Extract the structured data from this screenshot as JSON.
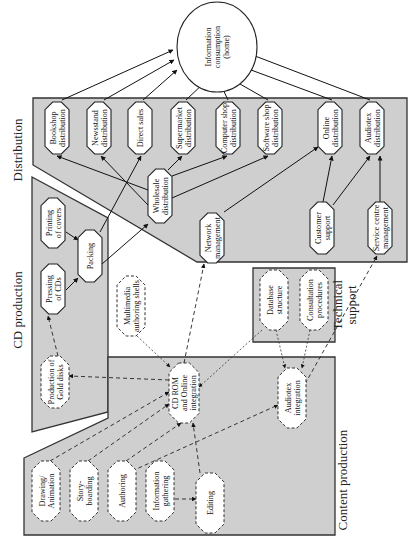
{
  "orientation": "rotated-90-ccw",
  "colors": {
    "panel_fill": "#cfcfcf",
    "panel_stroke": "#333333",
    "node_fill": "#ffffff",
    "edge": "#111111"
  },
  "panels": [
    {
      "id": "distribution",
      "label": "Distribution",
      "points": "33,98 407,98 407,262 197,262 33,165",
      "label_x": 22,
      "label_y": 150
    },
    {
      "id": "cd_production",
      "label": "CD production",
      "points": "32,177 108,218 108,412 32,432",
      "label_x": 22,
      "label_y": 310
    },
    {
      "id": "technical_support",
      "label": "Technical support",
      "points": "253,268 335,268 335,342 253,342",
      "label_x": 342,
      "label_y": 305
    },
    {
      "id": "content_production",
      "label": "Content production",
      "points": "24,458 108,418 108,357 335,357 335,535 24,535",
      "label_x": 347,
      "label_y": 480
    }
  ],
  "nodes": [
    {
      "id": "home",
      "label": [
        "Information",
        "consumption",
        "(home)"
      ],
      "shape": "ellipse",
      "style": "solid",
      "cx": 217,
      "cy": 47,
      "w": 80,
      "h": 90
    },
    {
      "id": "bookshop",
      "label": [
        "Bookshop",
        "distribution"
      ],
      "shape": "octagon",
      "style": "solid",
      "cx": 57,
      "cy": 128,
      "w": 24,
      "h": 52
    },
    {
      "id": "newsstand",
      "label": [
        "Newsstand",
        "distribution"
      ],
      "shape": "octagon",
      "style": "solid",
      "cx": 99,
      "cy": 128,
      "w": 24,
      "h": 52
    },
    {
      "id": "direct_sales",
      "label": [
        "Direct sales"
      ],
      "shape": "octagon",
      "style": "solid",
      "cx": 140,
      "cy": 128,
      "w": 24,
      "h": 52
    },
    {
      "id": "supermarket",
      "label": [
        "Supermarket",
        "distribution"
      ],
      "shape": "octagon",
      "style": "solid",
      "cx": 183,
      "cy": 128,
      "w": 24,
      "h": 52
    },
    {
      "id": "computer_shop",
      "label": [
        "Computer shop",
        "distribution"
      ],
      "shape": "octagon",
      "style": "solid",
      "cx": 228,
      "cy": 128,
      "w": 24,
      "h": 52
    },
    {
      "id": "software_shop",
      "label": [
        "Software shop",
        "distribution"
      ],
      "shape": "octagon",
      "style": "solid",
      "cx": 270,
      "cy": 128,
      "w": 24,
      "h": 52
    },
    {
      "id": "online_dist",
      "label": [
        "Online",
        "distribution"
      ],
      "shape": "octagon",
      "style": "solid",
      "cx": 330,
      "cy": 128,
      "w": 24,
      "h": 52
    },
    {
      "id": "audiotex_dist",
      "label": [
        "Audiotex",
        "distribution"
      ],
      "shape": "octagon",
      "style": "solid",
      "cx": 372,
      "cy": 128,
      "w": 24,
      "h": 52
    },
    {
      "id": "wholesale",
      "label": [
        "Wholesale",
        "distribution"
      ],
      "shape": "octagon",
      "style": "solid",
      "cx": 160,
      "cy": 196,
      "w": 24,
      "h": 54
    },
    {
      "id": "network_mgmt",
      "label": [
        "Network",
        "management"
      ],
      "shape": "octagon",
      "style": "solid",
      "cx": 212,
      "cy": 238,
      "w": 24,
      "h": 50
    },
    {
      "id": "customer_support",
      "label": [
        "Customer",
        "support"
      ],
      "shape": "octagon",
      "style": "solid",
      "cx": 322,
      "cy": 228,
      "w": 24,
      "h": 52
    },
    {
      "id": "service_centre",
      "label": [
        "Service centre",
        "management"
      ],
      "shape": "octagon",
      "style": "solid",
      "cx": 380,
      "cy": 228,
      "w": 24,
      "h": 52
    },
    {
      "id": "printing_covers",
      "label": [
        "Printing",
        "of covers"
      ],
      "shape": "octagon",
      "style": "solid",
      "cx": 53,
      "cy": 223,
      "w": 24,
      "h": 50
    },
    {
      "id": "pressing_cds",
      "label": [
        "Pressing",
        "of CDs"
      ],
      "shape": "octagon",
      "style": "solid",
      "cx": 53,
      "cy": 289,
      "w": 24,
      "h": 50
    },
    {
      "id": "packing",
      "label": [
        "Packing"
      ],
      "shape": "octagon",
      "style": "solid",
      "cx": 90,
      "cy": 256,
      "w": 24,
      "h": 52
    },
    {
      "id": "gold_disks",
      "label": [
        "Production of",
        "Gold disks"
      ],
      "shape": "octagon",
      "style": "dashed",
      "cx": 55,
      "cy": 382,
      "w": 28,
      "h": 52
    },
    {
      "id": "multimedia_shells",
      "label": [
        "Multimedia",
        "authoring shells"
      ],
      "shape": "octagon",
      "style": "dashed",
      "cx": 131,
      "cy": 306,
      "w": 28,
      "h": 60
    },
    {
      "id": "database_structure",
      "label": [
        "Database",
        "structure"
      ],
      "shape": "octagon",
      "style": "dashed",
      "cx": 274,
      "cy": 300,
      "w": 28,
      "h": 60
    },
    {
      "id": "consultation",
      "label": [
        "Consultation",
        "procedures"
      ],
      "shape": "octagon",
      "style": "dashed",
      "cx": 314,
      "cy": 300,
      "w": 28,
      "h": 60
    },
    {
      "id": "cdrom_online",
      "label": [
        "CD ROM",
        "and Online",
        "integration"
      ],
      "shape": "octagon",
      "style": "dashed",
      "cx": 184,
      "cy": 393,
      "w": 30,
      "h": 60
    },
    {
      "id": "audiotex_integration",
      "label": [
        "Audiotex",
        "integration"
      ],
      "shape": "octagon",
      "style": "dashed",
      "cx": 292,
      "cy": 398,
      "w": 28,
      "h": 60
    },
    {
      "id": "drawing",
      "label": [
        "Drawing/",
        "Animation"
      ],
      "shape": "octagon",
      "style": "dashed",
      "cx": 46,
      "cy": 491,
      "w": 28,
      "h": 60
    },
    {
      "id": "storyboarding",
      "label": [
        "Story-",
        "boarding"
      ],
      "shape": "octagon",
      "style": "dashed",
      "cx": 84,
      "cy": 491,
      "w": 28,
      "h": 60
    },
    {
      "id": "authoring",
      "label": [
        "Authoring"
      ],
      "shape": "octagon",
      "style": "dashed",
      "cx": 122,
      "cy": 491,
      "w": 28,
      "h": 60
    },
    {
      "id": "info_gathering",
      "label": [
        "Information",
        "gathering"
      ],
      "shape": "octagon",
      "style": "dashed",
      "cx": 160,
      "cy": 491,
      "w": 28,
      "h": 60
    },
    {
      "id": "editing",
      "label": [
        "Editing"
      ],
      "shape": "octagon",
      "style": "dashed",
      "cx": 210,
      "cy": 503,
      "w": 28,
      "h": 60
    }
  ],
  "edges": [
    {
      "from": "bookshop",
      "to": "home",
      "style": "solid",
      "d": "M62,100 L173,50"
    },
    {
      "from": "newsstand",
      "to": "home",
      "style": "solid",
      "d": "M104,100 L174,60"
    },
    {
      "from": "direct_sales",
      "to": "home",
      "style": "solid",
      "d": "M143,100 L177,70"
    },
    {
      "from": "supermarket",
      "to": "home",
      "style": "solid",
      "d": "M186,100 L205,82"
    },
    {
      "from": "computer_shop",
      "to": "home",
      "style": "solid",
      "d": "M228,100 L221,85"
    },
    {
      "from": "software_shop",
      "to": "home",
      "style": "solid",
      "d": "M268,100 L233,80"
    },
    {
      "from": "online_dist",
      "to": "home",
      "style": "solid",
      "d": "M332,100 L243,67"
    },
    {
      "from": "audiotex_dist",
      "to": "home",
      "style": "solid",
      "d": "M370,100 L242,51"
    },
    {
      "from": "wholesale",
      "to": "bookshop",
      "style": "solid",
      "d": "M148,190 L57,156"
    },
    {
      "from": "wholesale",
      "to": "newsstand",
      "style": "solid",
      "d": "M148,205 L101,156"
    },
    {
      "from": "wholesale",
      "to": "supermarket",
      "style": "solid",
      "d": "M168,170 L182,156"
    },
    {
      "from": "wholesale",
      "to": "computer_shop",
      "style": "solid",
      "d": "M172,176 L227,156"
    },
    {
      "from": "wholesale",
      "to": "software_shop",
      "style": "solid",
      "d": "M172,198 L268,156"
    },
    {
      "from": "network_mgmt",
      "to": "online_dist",
      "style": "solid",
      "d": "M224,212 L318,147"
    },
    {
      "from": "customer_support",
      "to": "online_dist",
      "style": "solid",
      "d": "M323,202 L332,156"
    },
    {
      "from": "customer_support",
      "to": "audiotex_dist",
      "style": "solid",
      "d": "M333,205 L370,156"
    },
    {
      "from": "service_centre",
      "to": "audiotex_dist",
      "style": "solid",
      "d": "M380,202 L380,156"
    },
    {
      "from": "printing_covers",
      "to": "packing",
      "style": "solid",
      "d": "M66,232 L78,240"
    },
    {
      "from": "pressing_cds",
      "to": "packing",
      "style": "solid",
      "d": "M66,290 L78,278"
    },
    {
      "from": "packing",
      "to": "direct_sales",
      "style": "solid",
      "d": "M100,232 L141,156"
    },
    {
      "from": "packing",
      "to": "wholesale",
      "style": "solid",
      "d": "M102,264 L148,224"
    },
    {
      "from": "gold_disks",
      "to": "pressing_cds",
      "style": "dashed",
      "d": "M58,356 L48,316"
    },
    {
      "from": "cdrom_online",
      "to": "gold_disks",
      "style": "dashed",
      "d": "M169,380 L69,376"
    },
    {
      "from": "cdrom_online",
      "to": "network_mgmt",
      "style": "dashed",
      "d": "M184,363 L204,264"
    },
    {
      "from": "multimedia_shells",
      "to": "cdrom_online",
      "style": "dotted",
      "d": "M137,336 L170,367"
    },
    {
      "from": "database_structure",
      "to": "cdrom_online",
      "style": "dotted",
      "d": "M262,330 L199,387"
    },
    {
      "from": "database_structure",
      "to": "audiotex_integration",
      "style": "dotted",
      "d": "M276,330 L285,368"
    },
    {
      "from": "consultation",
      "to": "audiotex_integration",
      "style": "dotted",
      "d": "M310,330 L302,368"
    },
    {
      "from": "audiotex_integration",
      "to": "service_centre",
      "style": "dashed",
      "d": "M305,384 L377,256"
    },
    {
      "from": "drawing",
      "to": "cdrom_online",
      "style": "dashed",
      "d": "M50,461 L169,392"
    },
    {
      "from": "storyboarding",
      "to": "cdrom_online",
      "style": "dashed",
      "d": "M88,461 L169,404"
    },
    {
      "from": "authoring",
      "to": "cdrom_online",
      "style": "dashed",
      "d": "M126,461 L181,423"
    },
    {
      "from": "authoring",
      "to": "audiotex_integration",
      "style": "dashed",
      "d": "M132,471 L278,405"
    },
    {
      "from": "info_gathering",
      "to": "editing",
      "style": "dashed",
      "d": "M175,499 L196,499"
    },
    {
      "from": "editing",
      "to": "cdrom_online",
      "style": "dashed",
      "d": "M200,473 L193,423"
    }
  ]
}
